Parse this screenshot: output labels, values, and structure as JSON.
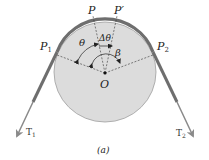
{
  "figure": {
    "caption": "(a)",
    "colors": {
      "drum_fill": "#dcdcdc",
      "drum_edge": "#9a9a9a",
      "belt": "#6e6e6e",
      "belt_edge": "#4a4a4a",
      "arrow": "#8a8a8a",
      "dashed": "#333333",
      "text": "#222222"
    },
    "labels": {
      "p": "P",
      "p_prime": "P′",
      "p1": "P",
      "p1_sub": "1",
      "p2": "P",
      "p2_sub": "2",
      "theta": "θ",
      "delta_theta": "Δθ",
      "beta": "β",
      "origin": "O",
      "t1": "T",
      "t1_sub": "1",
      "t2": "T",
      "t2_sub": "2"
    }
  }
}
